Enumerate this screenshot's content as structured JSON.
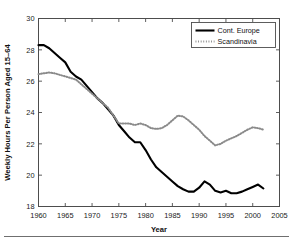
{
  "figure": {
    "background_color": "#ffffff",
    "axis_color": "#4d4d4d",
    "rule_color": "#6f6f6f"
  },
  "chart_data": {
    "type": "line",
    "title": "",
    "xlabel": "Year",
    "ylabel": "Weekly Hours Per Person Aged 15–64",
    "xlim": [
      1960,
      2005
    ],
    "ylim": [
      18,
      30
    ],
    "xticks": [
      1960,
      1965,
      1970,
      1975,
      1980,
      1985,
      1990,
      1995,
      2000,
      2005
    ],
    "yticks": [
      18,
      20,
      22,
      24,
      26,
      28,
      30
    ],
    "grid": false,
    "legend_position": "upper-right",
    "series": [
      {
        "name": "Cont. Europe",
        "style": "solid",
        "color": "#000000",
        "linewidth": 2.1,
        "x": [
          1960,
          1961,
          1962,
          1963,
          1964,
          1965,
          1966,
          1967,
          1968,
          1969,
          1970,
          1971,
          1972,
          1973,
          1974,
          1975,
          1976,
          1977,
          1978,
          1979,
          1980,
          1981,
          1982,
          1983,
          1984,
          1985,
          1986,
          1987,
          1988,
          1989,
          1990,
          1991,
          1992,
          1993,
          1994,
          1995,
          1996,
          1997,
          1998,
          1999,
          2000,
          2001,
          2002
        ],
        "values": [
          28.3,
          28.3,
          28.1,
          27.8,
          27.5,
          27.2,
          26.6,
          26.3,
          26.1,
          25.7,
          25.3,
          24.9,
          24.6,
          24.2,
          23.8,
          23.2,
          22.8,
          22.4,
          22.1,
          22.1,
          21.6,
          21.0,
          20.5,
          20.2,
          19.9,
          19.6,
          19.3,
          19.1,
          18.95,
          18.95,
          19.2,
          19.6,
          19.4,
          19.0,
          18.9,
          19.0,
          18.85,
          18.85,
          18.95,
          19.1,
          19.25,
          19.4,
          19.15
        ]
      },
      {
        "name": "Scandinavia",
        "style": "dotted",
        "color": "#8a8a8a",
        "linewidth": 2.0,
        "x": [
          1960,
          1961,
          1962,
          1963,
          1964,
          1965,
          1966,
          1967,
          1968,
          1969,
          1970,
          1971,
          1972,
          1973,
          1974,
          1975,
          1976,
          1977,
          1978,
          1979,
          1980,
          1981,
          1982,
          1983,
          1984,
          1985,
          1986,
          1987,
          1988,
          1989,
          1990,
          1991,
          1992,
          1993,
          1994,
          1995,
          1996,
          1997,
          1998,
          1999,
          2000,
          2001,
          2002
        ],
        "values": [
          26.45,
          26.5,
          26.55,
          26.5,
          26.4,
          26.3,
          26.2,
          26.1,
          25.8,
          25.5,
          25.2,
          24.9,
          24.6,
          24.3,
          23.8,
          23.3,
          23.3,
          23.3,
          23.2,
          23.3,
          23.2,
          23.0,
          22.95,
          23.0,
          23.2,
          23.5,
          23.8,
          23.75,
          23.5,
          23.2,
          22.9,
          22.5,
          22.2,
          21.9,
          22.0,
          22.2,
          22.35,
          22.5,
          22.7,
          22.9,
          23.05,
          23.0,
          22.9
        ]
      }
    ]
  },
  "legend": {
    "items": [
      {
        "label": "Cont. Europe",
        "swatch": "solid-line-swatch"
      },
      {
        "label": "Scandinavia",
        "swatch": "dotted-line-swatch"
      }
    ]
  }
}
